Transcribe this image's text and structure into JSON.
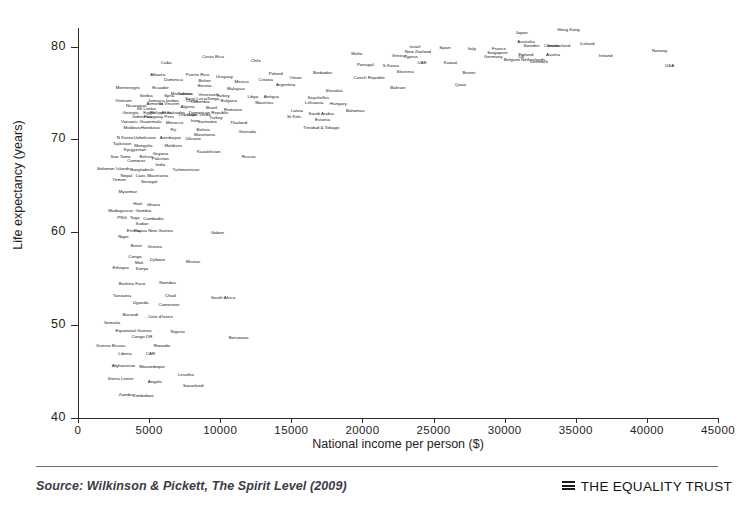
{
  "chart_data": {
    "type": "scatter",
    "title": "",
    "xlabel": "National income per person ($)",
    "ylabel": "Life expectancy (years)",
    "xlim": [
      0,
      45000
    ],
    "ylim": [
      40,
      82
    ],
    "xticks": [
      "0",
      "5000",
      "10000",
      "15000",
      "20000",
      "25000",
      "30000",
      "35000",
      "40000",
      "45000"
    ],
    "yticks": [
      "40",
      "50",
      "60",
      "70",
      "80"
    ],
    "grid": false,
    "legend": null,
    "point_label_field": "country",
    "points": [
      {
        "country": "Hong Kong",
        "x": 34500,
        "y": 81.9
      },
      {
        "country": "Japan",
        "x": 31200,
        "y": 81.6
      },
      {
        "country": "Australia",
        "x": 31500,
        "y": 80.6
      },
      {
        "country": "Iceland",
        "x": 35800,
        "y": 80.4
      },
      {
        "country": "Switzerland",
        "x": 33800,
        "y": 80.2
      },
      {
        "country": "Sweden",
        "x": 31900,
        "y": 80.2
      },
      {
        "country": "Canada",
        "x": 33300,
        "y": 80.2
      },
      {
        "country": "Israel",
        "x": 23700,
        "y": 80.1
      },
      {
        "country": "Spain",
        "x": 25800,
        "y": 80.0
      },
      {
        "country": "Italy",
        "x": 27700,
        "y": 79.9
      },
      {
        "country": "France",
        "x": 29600,
        "y": 79.9
      },
      {
        "country": "Norway",
        "x": 40900,
        "y": 79.6
      },
      {
        "country": "New Zealand",
        "x": 23900,
        "y": 79.5
      },
      {
        "country": "Singapore",
        "x": 29500,
        "y": 79.4
      },
      {
        "country": "Austria",
        "x": 33400,
        "y": 79.2
      },
      {
        "country": "Finland",
        "x": 31500,
        "y": 79.2
      },
      {
        "country": "Ireland",
        "x": 37100,
        "y": 79.1
      },
      {
        "country": "Greece",
        "x": 22600,
        "y": 79.1
      },
      {
        "country": "UK",
        "x": 31200,
        "y": 79.0
      },
      {
        "country": "Germany",
        "x": 29200,
        "y": 79.0
      },
      {
        "country": "Netherlands",
        "x": 32000,
        "y": 78.7
      },
      {
        "country": "Belgium",
        "x": 30500,
        "y": 78.7
      },
      {
        "country": "Denmark",
        "x": 32400,
        "y": 78.4
      },
      {
        "country": "USA",
        "x": 41600,
        "y": 78.0
      },
      {
        "country": "Malta",
        "x": 19600,
        "y": 79.3
      },
      {
        "country": "Cyprus",
        "x": 23400,
        "y": 79.0
      },
      {
        "country": "Costa Rica",
        "x": 9500,
        "y": 79.0
      },
      {
        "country": "Chile",
        "x": 12500,
        "y": 78.6
      },
      {
        "country": "Kuwait",
        "x": 26200,
        "y": 78.3
      },
      {
        "country": "UAE",
        "x": 24200,
        "y": 78.3
      },
      {
        "country": "Portugal",
        "x": 20200,
        "y": 78.1
      },
      {
        "country": "S Korea",
        "x": 22000,
        "y": 78.0
      },
      {
        "country": "Slovenia",
        "x": 23000,
        "y": 77.4
      },
      {
        "country": "Brunei",
        "x": 27500,
        "y": 77.3
      },
      {
        "country": "Cuba",
        "x": 6200,
        "y": 78.3
      },
      {
        "country": "Barbados",
        "x": 17200,
        "y": 77.3
      },
      {
        "country": "Poland",
        "x": 13900,
        "y": 77.2
      },
      {
        "country": "Qatar",
        "x": 26900,
        "y": 76.0
      },
      {
        "country": "Albania",
        "x": 5600,
        "y": 77.0
      },
      {
        "country": "Puerto Rico",
        "x": 8400,
        "y": 77.0
      },
      {
        "country": "Uruguay",
        "x": 10300,
        "y": 76.8
      },
      {
        "country": "Czech Republic",
        "x": 20500,
        "y": 76.7
      },
      {
        "country": "Oman",
        "x": 15300,
        "y": 76.7
      },
      {
        "country": "Croatia",
        "x": 13200,
        "y": 76.5
      },
      {
        "country": "Dominica",
        "x": 6700,
        "y": 76.5
      },
      {
        "country": "Belize",
        "x": 8900,
        "y": 76.4
      },
      {
        "country": "Mexico",
        "x": 11500,
        "y": 76.3
      },
      {
        "country": "Argentina",
        "x": 14600,
        "y": 76.0
      },
      {
        "country": "Bahrain",
        "x": 22500,
        "y": 75.6
      },
      {
        "country": "Bosnia",
        "x": 8900,
        "y": 75.9
      },
      {
        "country": "Ecuador",
        "x": 5800,
        "y": 75.6
      },
      {
        "country": "Montenegro",
        "x": 3500,
        "y": 75.6
      },
      {
        "country": "Malaysia",
        "x": 11100,
        "y": 75.5
      },
      {
        "country": "Slovakia",
        "x": 18000,
        "y": 75.3
      },
      {
        "country": "Macedonia",
        "x": 7300,
        "y": 75.0
      },
      {
        "country": "Tunisia",
        "x": 7500,
        "y": 75.0
      },
      {
        "country": "Venezuela",
        "x": 9200,
        "y": 74.9
      },
      {
        "country": "Turkey",
        "x": 10200,
        "y": 74.8
      },
      {
        "country": "Serbia",
        "x": 4800,
        "y": 74.8
      },
      {
        "country": "Syria",
        "x": 6400,
        "y": 74.8
      },
      {
        "country": "Libya",
        "x": 12300,
        "y": 74.7
      },
      {
        "country": "Antigua",
        "x": 13600,
        "y": 74.7
      },
      {
        "country": "Seychelles",
        "x": 16900,
        "y": 74.6
      },
      {
        "country": "Saint Lucia",
        "x": 8300,
        "y": 74.5
      },
      {
        "country": "Tonga",
        "x": 9500,
        "y": 74.5
      },
      {
        "country": "China",
        "x": 8000,
        "y": 74.3
      },
      {
        "country": "Bulgaria",
        "x": 10600,
        "y": 74.2
      },
      {
        "country": "Jamaica",
        "x": 5500,
        "y": 74.3
      },
      {
        "country": "Jordan",
        "x": 6600,
        "y": 74.3
      },
      {
        "country": "Vietnam",
        "x": 3200,
        "y": 74.3
      },
      {
        "country": "Colombia",
        "x": 8600,
        "y": 74.1
      },
      {
        "country": "Mauritius",
        "x": 13100,
        "y": 74.0
      },
      {
        "country": "Lithuania",
        "x": 16600,
        "y": 74.0
      },
      {
        "country": "Hungary",
        "x": 18300,
        "y": 73.9
      },
      {
        "country": "Armenia",
        "x": 5400,
        "y": 73.9
      },
      {
        "country": "St Vincent",
        "x": 6400,
        "y": 73.9
      },
      {
        "country": "Nicaragua",
        "x": 4100,
        "y": 73.7
      },
      {
        "country": "Algeria",
        "x": 7700,
        "y": 73.6
      },
      {
        "country": "Brazil",
        "x": 9400,
        "y": 73.5
      },
      {
        "country": "Romania",
        "x": 10900,
        "y": 73.3
      },
      {
        "country": "Sri Lanka",
        "x": 4800,
        "y": 73.4
      },
      {
        "country": "Latvia",
        "x": 15400,
        "y": 73.2
      },
      {
        "country": "Bahamas",
        "x": 19500,
        "y": 73.2
      },
      {
        "country": "Georgia",
        "x": 3700,
        "y": 73.0
      },
      {
        "country": "Egypt",
        "x": 5000,
        "y": 73.0
      },
      {
        "country": "Philippines",
        "x": 5800,
        "y": 73.0
      },
      {
        "country": "El Salvador",
        "x": 6700,
        "y": 73.0
      },
      {
        "country": "Dominican Republic",
        "x": 9200,
        "y": 73.0
      },
      {
        "country": "Lebanon",
        "x": 7700,
        "y": 72.7
      },
      {
        "country": "Cape Verde",
        "x": 8500,
        "y": 72.7
      },
      {
        "country": "Turkey2",
        "x": 9700,
        "y": 72.4
      },
      {
        "country": "St Kitts",
        "x": 15200,
        "y": 72.5
      },
      {
        "country": "Saudi Arabia",
        "x": 17100,
        "y": 72.8
      },
      {
        "country": "Indonesia",
        "x": 4500,
        "y": 72.5
      },
      {
        "country": "Paraguay",
        "x": 5300,
        "y": 72.5
      },
      {
        "country": "Peru",
        "x": 6400,
        "y": 72.5
      },
      {
        "country": "Estonia",
        "x": 17200,
        "y": 72.2
      },
      {
        "country": "Iran",
        "x": 8200,
        "y": 72.1
      },
      {
        "country": "Suriname",
        "x": 9100,
        "y": 72.0
      },
      {
        "country": "Thailand",
        "x": 11300,
        "y": 71.9
      },
      {
        "country": "Vanuatu",
        "x": 3600,
        "y": 72.0
      },
      {
        "country": "Guatemala",
        "x": 5100,
        "y": 72.0
      },
      {
        "country": "Morocco",
        "x": 6800,
        "y": 71.9
      },
      {
        "country": "Trinidad & Tobago",
        "x": 17100,
        "y": 71.3
      },
      {
        "country": "Moldova",
        "x": 3800,
        "y": 71.3
      },
      {
        "country": "Honduras",
        "x": 5100,
        "y": 71.3
      },
      {
        "country": "Bolivia",
        "x": 8800,
        "y": 71.1
      },
      {
        "country": "Fiji",
        "x": 6700,
        "y": 71.1
      },
      {
        "country": "Grenada",
        "x": 11900,
        "y": 70.9
      },
      {
        "country": "Mauritania2",
        "x": 8900,
        "y": 70.6
      },
      {
        "country": "N Korea",
        "x": 3300,
        "y": 70.3
      },
      {
        "country": "Uzbekistan",
        "x": 4700,
        "y": 70.3
      },
      {
        "country": "Azerbaijan",
        "x": 6500,
        "y": 70.3
      },
      {
        "country": "Ukraine",
        "x": 8100,
        "y": 70.2
      },
      {
        "country": "Tajikistan",
        "x": 3100,
        "y": 69.6
      },
      {
        "country": "Mongolia",
        "x": 4600,
        "y": 69.4
      },
      {
        "country": "Maldives",
        "x": 6700,
        "y": 69.4
      },
      {
        "country": "Kyrgyzstan",
        "x": 4000,
        "y": 69.0
      },
      {
        "country": "Kazakhstan",
        "x": 9200,
        "y": 68.8
      },
      {
        "country": "Guyana",
        "x": 5800,
        "y": 68.5
      },
      {
        "country": "Sao Tome",
        "x": 3000,
        "y": 68.2
      },
      {
        "country": "Bolivia2",
        "x": 4800,
        "y": 68.2
      },
      {
        "country": "Pakistan",
        "x": 5800,
        "y": 68.0
      },
      {
        "country": "Comoros",
        "x": 4100,
        "y": 67.8
      },
      {
        "country": "Russia",
        "x": 12000,
        "y": 68.2
      },
      {
        "country": "India",
        "x": 5800,
        "y": 67.4
      },
      {
        "country": "Solomon Islands",
        "x": 2500,
        "y": 66.9
      },
      {
        "country": "Bangladesh",
        "x": 4500,
        "y": 66.8
      },
      {
        "country": "Turkmenistan",
        "x": 7600,
        "y": 66.8
      },
      {
        "country": "Nepal",
        "x": 3400,
        "y": 66.2
      },
      {
        "country": "Laos",
        "x": 4400,
        "y": 66.2
      },
      {
        "country": "Mauritania",
        "x": 5600,
        "y": 66.2
      },
      {
        "country": "Yemen",
        "x": 2900,
        "y": 65.7
      },
      {
        "country": "Senegal",
        "x": 5000,
        "y": 65.5
      },
      {
        "country": "Myanmar",
        "x": 3500,
        "y": 64.4
      },
      {
        "country": "Haiti",
        "x": 4200,
        "y": 63.2
      },
      {
        "country": "Ghana",
        "x": 5300,
        "y": 63.0
      },
      {
        "country": "Madagascar",
        "x": 3000,
        "y": 62.4
      },
      {
        "country": "Gambia",
        "x": 4600,
        "y": 62.4
      },
      {
        "country": "PNG",
        "x": 3100,
        "y": 61.7
      },
      {
        "country": "Togo",
        "x": 4000,
        "y": 61.7
      },
      {
        "country": "Cambodia",
        "x": 5300,
        "y": 61.5
      },
      {
        "country": "Sudan",
        "x": 4500,
        "y": 61.0
      },
      {
        "country": "Eritrea",
        "x": 3900,
        "y": 60.3
      },
      {
        "country": "Papua New Guinea",
        "x": 5300,
        "y": 60.2
      },
      {
        "country": "Gabon",
        "x": 9800,
        "y": 60.0
      },
      {
        "country": "Niger",
        "x": 3200,
        "y": 59.6
      },
      {
        "country": "Benin",
        "x": 4100,
        "y": 58.6
      },
      {
        "country": "Guinea",
        "x": 5400,
        "y": 58.5
      },
      {
        "country": "Congo",
        "x": 4000,
        "y": 57.5
      },
      {
        "country": "Djibouti",
        "x": 5600,
        "y": 57.1
      },
      {
        "country": "Mali",
        "x": 4300,
        "y": 56.8
      },
      {
        "country": "Bhutan",
        "x": 8100,
        "y": 56.9
      },
      {
        "country": "Ethiopia",
        "x": 3000,
        "y": 56.3
      },
      {
        "country": "Kenya",
        "x": 4500,
        "y": 56.2
      },
      {
        "country": "Namibia",
        "x": 6300,
        "y": 54.7
      },
      {
        "country": "Burkina Faso",
        "x": 3800,
        "y": 54.5
      },
      {
        "country": "Tanzania",
        "x": 3100,
        "y": 53.2
      },
      {
        "country": "Chad",
        "x": 6500,
        "y": 53.2
      },
      {
        "country": "South Africa",
        "x": 10200,
        "y": 53.0
      },
      {
        "country": "Uganda",
        "x": 4400,
        "y": 52.5
      },
      {
        "country": "Cameroon",
        "x": 6400,
        "y": 52.3
      },
      {
        "country": "Burundi",
        "x": 3700,
        "y": 51.2
      },
      {
        "country": "Cote d'Ivoire",
        "x": 5800,
        "y": 51.0
      },
      {
        "country": "Somalia",
        "x": 2400,
        "y": 50.3
      },
      {
        "country": "Equatorial Guinea",
        "x": 3900,
        "y": 49.5
      },
      {
        "country": "Nigeria",
        "x": 7000,
        "y": 49.4
      },
      {
        "country": "Congo DR",
        "x": 4500,
        "y": 48.8
      },
      {
        "country": "Botswana",
        "x": 11300,
        "y": 48.7
      },
      {
        "country": "Guinea Bissau",
        "x": 2300,
        "y": 47.9
      },
      {
        "country": "Rwanda",
        "x": 5900,
        "y": 47.9
      },
      {
        "country": "Liberia",
        "x": 3300,
        "y": 47.0
      },
      {
        "country": "CAR",
        "x": 5100,
        "y": 47.0
      },
      {
        "country": "Afghanistan",
        "x": 3200,
        "y": 45.7
      },
      {
        "country": "Mozambique",
        "x": 5200,
        "y": 45.6
      },
      {
        "country": "Lesotho",
        "x": 7600,
        "y": 44.7
      },
      {
        "country": "Sierra Leone",
        "x": 3000,
        "y": 44.3
      },
      {
        "country": "Angola",
        "x": 5400,
        "y": 44.0
      },
      {
        "country": "Swaziland",
        "x": 8100,
        "y": 43.6
      },
      {
        "country": "Zambia",
        "x": 3400,
        "y": 42.6
      },
      {
        "country": "Zimbabwe",
        "x": 4600,
        "y": 42.5
      }
    ]
  },
  "footer": {
    "source": "Source: Wilkinson & Pickett, The Spirit Level (2009)",
    "brand": "THE EQUALITY TRUST"
  }
}
